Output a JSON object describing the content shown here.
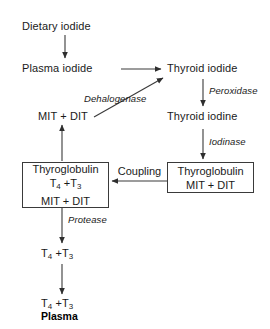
{
  "diagram": {
    "background_color": "#ffffff",
    "line_color": "#3a3a3a",
    "text_color": "#1a1a1a",
    "nodes": {
      "dietary_iodide": "Dietary iodide",
      "plasma_iodide": "Plasma iodide",
      "thyroid_iodide": "Thyroid iodide",
      "thyroid_iodine": "Thyroid iodine",
      "mit_dit": "MIT + DIT",
      "thyroglobulin_right_line1": "Thyroglobulin",
      "thyroglobulin_right_line2": "MIT + DIT",
      "thyroglobulin_left_line1": "Thyroglobulin",
      "thyroglobulin_left_line2": "T4 + T3",
      "thyroglobulin_left_line3": "MIT + DIT",
      "t4_t3_mid": "T4 + T3",
      "t4_t3_bottom": "T4 + T3",
      "plasma": "Plasma"
    },
    "enzymes": {
      "peroxidase": "Peroxidase",
      "dehalogenase": "Dehalogenase",
      "iodinase": "Iodinase",
      "coupling": "Coupling",
      "protease": "Protease"
    },
    "edges": [
      {
        "name": "dietary-to-plasma",
        "from": "dietary_iodide",
        "to": "plasma_iodide",
        "label": ""
      },
      {
        "name": "plasma-to-thyroid-iodide",
        "from": "plasma_iodide",
        "to": "thyroid_iodide",
        "label": ""
      },
      {
        "name": "thyroid-iodide-to-thyroid-iodine",
        "from": "thyroid_iodide",
        "to": "thyroid_iodine",
        "label": "Peroxidase"
      },
      {
        "name": "thyroid-iodine-to-thyroglobulin-right",
        "from": "thyroid_iodine",
        "to": "thyroglobulin_right",
        "label": "Iodinase"
      },
      {
        "name": "thyroglobulin-right-to-left",
        "from": "thyroglobulin_right",
        "to": "thyroglobulin_left",
        "label": "Coupling"
      },
      {
        "name": "thyroglobulin-left-to-mit-dit",
        "from": "thyroglobulin_left",
        "to": "mit_dit",
        "label": ""
      },
      {
        "name": "mit-dit-to-thyroid-iodide",
        "from": "mit_dit",
        "to": "thyroid_iodide",
        "label": "Dehalogenase"
      },
      {
        "name": "thyroglobulin-left-to-t4-t3",
        "from": "thyroglobulin_left",
        "to": "t4_t3_mid",
        "label": "Protease"
      },
      {
        "name": "t4-t3-to-plasma",
        "from": "t4_t3_mid",
        "to": "t4_t3_bottom",
        "label": ""
      }
    ]
  }
}
